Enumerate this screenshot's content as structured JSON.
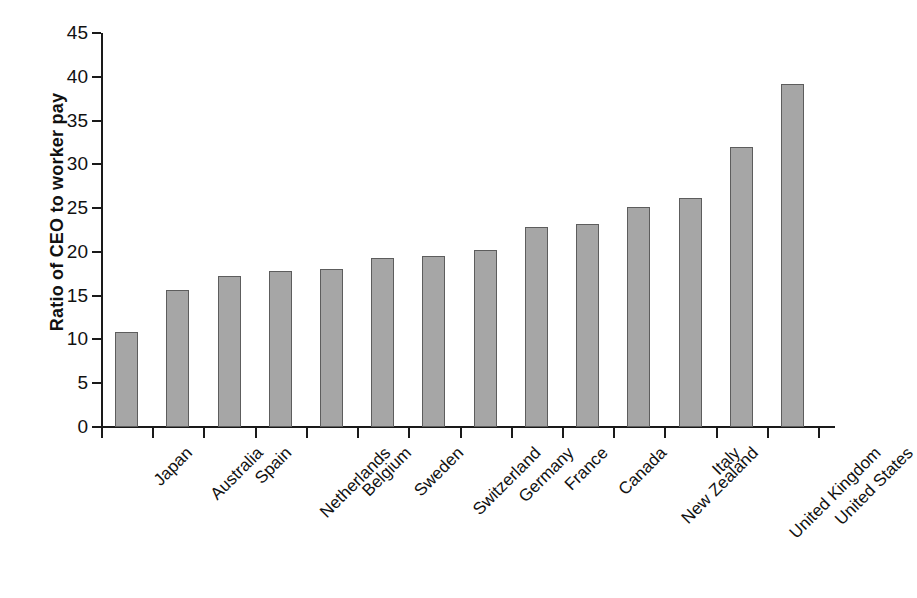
{
  "chart_data": {
    "type": "bar",
    "title": "",
    "xlabel": "",
    "ylabel": "Ratio of CEO to worker pay",
    "ylim": [
      0,
      45
    ],
    "ytick_step": 5,
    "grid": false,
    "legend": "none",
    "bar_color": "#a6a6a6",
    "bar_edge_color": "#5d5d5d",
    "axis_color": "#1a1a1a",
    "categories": [
      "Japan",
      "Australia",
      "Spain",
      "Netherlands",
      "Belgium",
      "Sweden",
      "Switzerland",
      "Germany",
      "France",
      "Canada",
      "New Zealand",
      "Italy",
      "United Kingdom",
      "United States"
    ],
    "values": [
      10.8,
      15.6,
      17.2,
      17.8,
      18.1,
      19.3,
      19.5,
      20.2,
      22.9,
      23.2,
      25.1,
      26.2,
      32.0,
      39.2
    ],
    "ytick_labels": [
      "0",
      "5",
      "10",
      "15",
      "20",
      "25",
      "30",
      "35",
      "40",
      "45"
    ],
    "ytick_values": [
      0,
      5,
      10,
      15,
      20,
      25,
      30,
      35,
      40,
      45
    ]
  }
}
